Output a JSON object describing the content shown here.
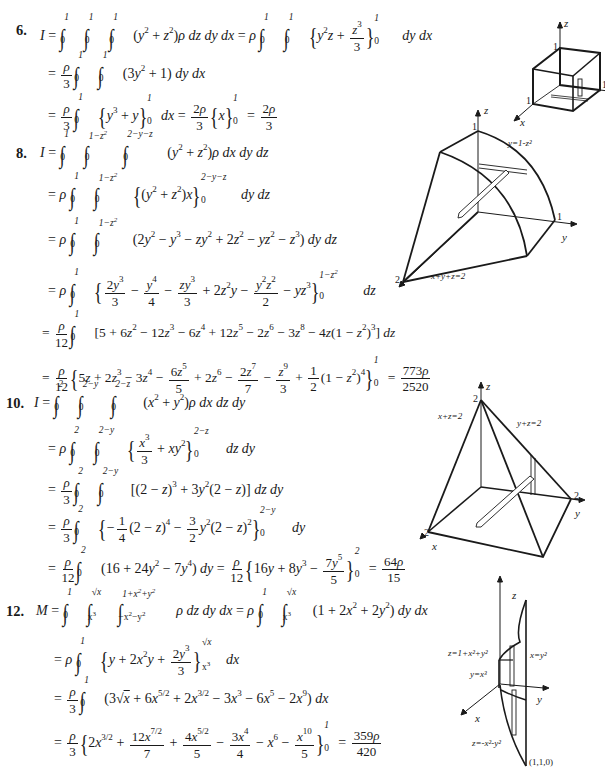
{
  "problems": [
    {
      "number": "6.",
      "lines": [
        "I = ∫₀¹ ∫₀¹ ∫₀¹ (y² + z²)ρ dz dy dx = ρ ∫₀¹ ∫₀¹ {y²z + z³/3}₀¹ dy dx",
        "= ρ/3 ∫₀¹ ∫₀¹ (3y² + 1) dy dx",
        "= ρ/3 ∫₀¹ {y³ + y}₀¹ dx = 2ρ/3 {x}₀¹ = 2ρ/3"
      ],
      "result": "2ρ/3",
      "figure": {
        "labels": [
          "z",
          "1",
          "1",
          "1",
          "x",
          "y"
        ]
      }
    },
    {
      "number": "8.",
      "lines": [
        "I = ∫₀¹ ∫₀^(1−z²) ∫₀^(2−y−z) (y² + z²)ρ dx dy dz",
        "= ρ ∫₀¹ ∫₀^(1−z²) {(y² + z²)x}₀^(2−y−z) dy dz",
        "= ρ ∫₀¹ ∫₀^(1−z²) (2y² − y³ − zy² + 2z² − yz² − z³) dy dz",
        "= ρ ∫₀¹ {2y³/3 − y⁴/4 − zy³/3 + 2z²y − y²z²/2 − yz³}₀^(1−z²) dz",
        "= ρ/12 ∫₀¹ [5 + 6z² − 12z³ − 6z⁴ + 12z⁵ − 2z⁶ − 3z⁸ − 4z(1 − z²)³] dz",
        "= ρ/12 {5z + 2z³ − 3z⁴ − 6z⁵/5 + 2z⁶ − 2z⁷/7 − z⁹/3 + 1/2(1 − z²)⁴}₀¹ = 773ρ/2520"
      ],
      "result": "773ρ/2520",
      "figure": {
        "labels": [
          "z",
          "1",
          "y=1-z²",
          "1",
          "y",
          "2",
          "x",
          "x+y+z=2"
        ]
      }
    },
    {
      "number": "10.",
      "lines": [
        "I = ∫₀² ∫₀^(2−y) ∫₀^(2−z) (x² + y²)ρ dx dz dy",
        "= ρ ∫₀² ∫₀^(2−y) {x³/3 + xy²}₀^(2−z) dz dy",
        "= ρ/3 ∫₀² ∫₀^(2−y) [(2 − z)³ + 3y²(2 − z)] dz dy",
        "= ρ/3 ∫₀² {−1/4(2 − z)⁴ − 3/2 y²(2 − z)²}₀^(2−y) dy",
        "= ρ/12 ∫₀² (16 + 24y² − 7y⁴) dy = ρ/12 {16y + 8y³ − 7y⁵/5}₀² = 64ρ/15"
      ],
      "result": "64ρ/15",
      "figure": {
        "labels": [
          "z",
          "2",
          "x+z=2",
          "y+z=2",
          "2",
          "y",
          "2",
          "x"
        ]
      }
    },
    {
      "number": "12.",
      "lines": [
        "M = ∫₀¹ ∫_(x³)^(√x) ∫_(−x²−y²)^(1+x²+y²) ρ dz dy dx = ρ ∫₀¹ ∫_(x³)^(√x) (1 + 2x² + 2y²) dy dx",
        "= ρ ∫₀¹ {y + 2x²y + 2y³/3}_(x³)^(√x) dx",
        "= ρ/3 ∫₀¹ (3√x + 6x^(5/2) + 2x^(3/2) − 3x³ − 6x⁵ − 2x⁹) dx",
        "= ρ/3 {2x^(3/2) + 12x^(7/2)/7 + 4x^(5/2)/5 − 3x⁴/4 − x⁶ − x¹⁰/5}₀¹ = 359ρ/420"
      ],
      "result": "359ρ/420",
      "figure": {
        "labels": [
          "z",
          "z=1+x²+y²",
          "x=y²",
          "y=x³",
          "y",
          "x",
          "z=-x²-y²",
          "(1,1,0)"
        ]
      }
    }
  ]
}
